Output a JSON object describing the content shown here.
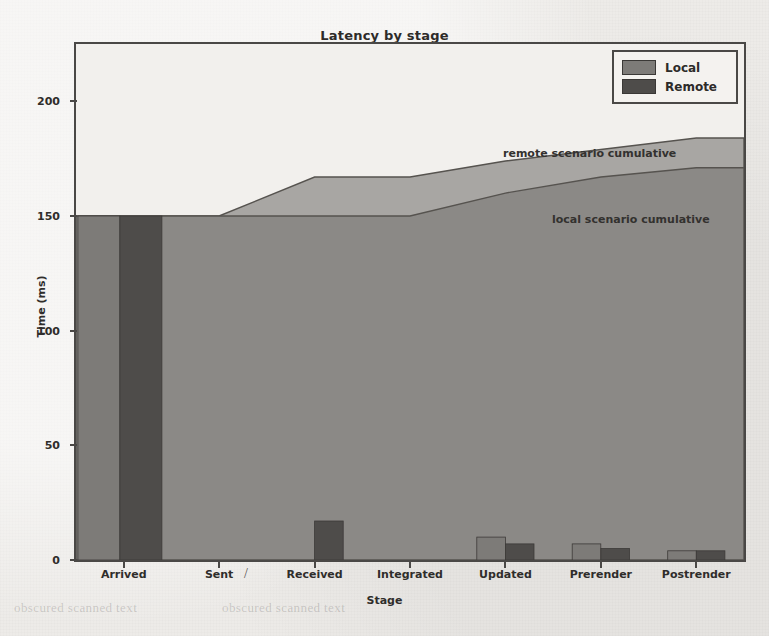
{
  "chart_data": {
    "type": "bar",
    "title": "Latency by stage",
    "xlabel": "Stage",
    "ylabel": "Time (ms)",
    "categories": [
      "Arrived",
      "Sent",
      "Received",
      "Integrated",
      "Updated",
      "Prerender",
      "Postrender"
    ],
    "series": [
      {
        "name": "Local",
        "color": "#7d7b78",
        "values": [
          150,
          0,
          0,
          0,
          10,
          7,
          4
        ]
      },
      {
        "name": "Remote",
        "color": "#4e4c4a",
        "values": [
          150,
          0,
          17,
          0,
          7,
          5,
          4
        ]
      }
    ],
    "cumulative_areas": [
      {
        "name": "local scenario cumulative",
        "color": "#8b8986",
        "values": [
          150,
          150,
          150,
          150,
          160,
          167,
          171
        ]
      },
      {
        "name": "remote scenario cumulative",
        "color": "#a8a6a3",
        "values": [
          150,
          150,
          167,
          167,
          174,
          179,
          184
        ]
      }
    ],
    "ylim": [
      0,
      225
    ],
    "yticks": [
      0,
      50,
      100,
      150,
      200
    ],
    "ytick_labels": [
      "0",
      "50",
      "100",
      "150",
      "200"
    ],
    "grid": false,
    "legend_position": "upper right",
    "annotations": [
      {
        "id": "remote",
        "text": "remote scenario cumulative"
      },
      {
        "id": "local",
        "text": "local scenario cumulative"
      }
    ]
  },
  "figure": {
    "title": "Latency by stage",
    "y_axis_label": "Time (ms)",
    "x_axis_label": "Stage",
    "ytick_labels": [
      "0",
      "50",
      "100",
      "150",
      "200"
    ],
    "xtick_labels": [
      "Arrived",
      "Sent",
      "Received",
      "Integrated",
      "Updated",
      "Prerender",
      "Postrender"
    ],
    "legend": {
      "entries": [
        {
          "label": "Local",
          "color": "#7d7b78"
        },
        {
          "label": "Remote",
          "color": "#4e4c4a"
        }
      ]
    },
    "annotations": {
      "remote": "remote scenario cumulative",
      "local": "local scenario cumulative"
    },
    "artifacts": {
      "slash": "/"
    }
  },
  "page_bleed": {
    "line1": "obscured scanned text",
    "line2": "obscured scanned text",
    "line3": "obscured scanned text",
    "line4": "obscured scanned text"
  }
}
